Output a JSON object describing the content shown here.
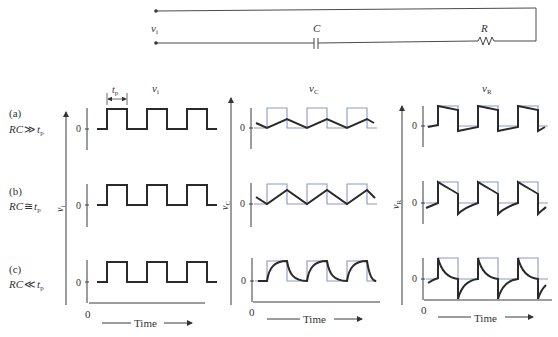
{
  "circuit": {
    "input_label": "v",
    "input_sub": "i",
    "capacitor_label": "C",
    "resistor_label": "R"
  },
  "columns": [
    {
      "title": "v",
      "title_sub": "i",
      "ylabel": "v",
      "ylabel_sub": "i"
    },
    {
      "title": "v",
      "title_sub": "C",
      "ylabel": "v",
      "ylabel_sub": "C"
    },
    {
      "title": "v",
      "title_sub": "R",
      "ylabel": "v",
      "ylabel_sub": "R"
    }
  ],
  "rows": [
    {
      "tag": "(a)",
      "cond_lhs": "RC",
      "cond_op": "≫",
      "cond_rhs": "t",
      "cond_sub": "p"
    },
    {
      "tag": "(b)",
      "cond_lhs": "RC",
      "cond_op": "≅",
      "cond_rhs": "t",
      "cond_sub": "p"
    },
    {
      "tag": "(c)",
      "cond_lhs": "RC",
      "cond_op": "≪",
      "cond_rhs": "t",
      "cond_sub": "p"
    }
  ],
  "pulse_width_label": "t",
  "pulse_width_sub": "p",
  "zero_label": "0",
  "origin_label": "0",
  "time_label": "Time",
  "colors": {
    "signal": "#2a2a2a",
    "reference": "#8d97c9"
  }
}
